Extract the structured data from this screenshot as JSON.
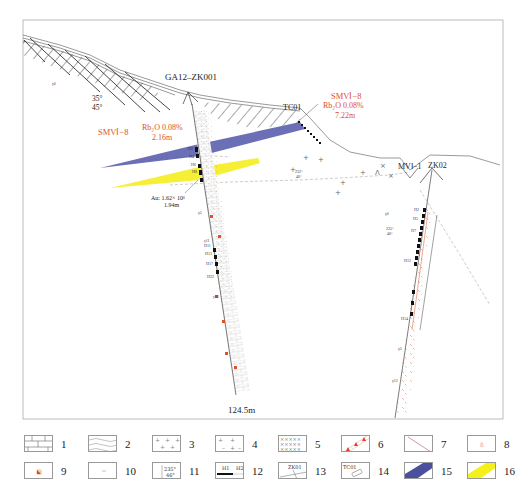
{
  "diagram": {
    "type": "geological-cross-section",
    "frame": {
      "x": 23,
      "y": 20,
      "w": 480,
      "h": 399
    }
  },
  "drillholes": [
    {
      "id": "GA12-ZK001",
      "label": "GA12–ZK001",
      "depth_label": "124.5m"
    },
    {
      "id": "ZK02",
      "label": "ZK02"
    }
  ],
  "trench": {
    "label": "TC01"
  },
  "section_label_mv": "MVⅠ−1",
  "orebodies": [
    {
      "name": "SMVI-8 (ZK001)",
      "label": "SMVⅠ−8",
      "grade": "Rb₂O 0.08%",
      "thickness": "2.16m",
      "color": "#6b6fb8"
    },
    {
      "name": "SMVI-8 (TC01)",
      "label": "SMVⅠ−8",
      "grade": "Rb₂O 0.08%",
      "thickness": "7.22m",
      "color": "#6b6fb8"
    },
    {
      "name": "Au body",
      "grade": "Au: 1.62× 10⁶",
      "thickness": "1.94m",
      "color": "#f4ee2a"
    }
  ],
  "attitudes": {
    "upper_left": {
      "a": "35°",
      "b": "45°"
    },
    "mid": {
      "a": "232°",
      "b": "46°"
    },
    "right": {
      "a": "235°",
      "b": "46°"
    }
  },
  "annotations": {
    "gamma": "γδ",
    "sample_labels_zk001": [
      "H2",
      "H3",
      "H4",
      "H5",
      "H6",
      "H7",
      "H8",
      "H9",
      "H11",
      "H13",
      "H15",
      "H17",
      "H22",
      "γ1",
      "γ5",
      "γ11",
      "γ13"
    ],
    "sample_labels_tc01": [
      "H1",
      "H2",
      "H3",
      "H4",
      "H5",
      "H6",
      "H7",
      "H8"
    ],
    "sample_labels_zk02": [
      "H2",
      "H5",
      "H6",
      "H7",
      "H8",
      "H9",
      "H11",
      "H12",
      "H13",
      "H14",
      "γ3",
      "γ5",
      "γ12"
    ]
  },
  "legend": {
    "items": [
      {
        "num": "1",
        "name": "limestone-brick"
      },
      {
        "num": "2",
        "name": "wavy-schist"
      },
      {
        "num": "3",
        "name": "plus-granite"
      },
      {
        "num": "4",
        "name": "plus-dash-granite"
      },
      {
        "num": "5",
        "name": "x-diorite"
      },
      {
        "num": "6",
        "name": "red-triangle-band"
      },
      {
        "num": "7",
        "name": "fault-line"
      },
      {
        "num": "8",
        "name": "pink-point"
      },
      {
        "num": "9",
        "name": "orange-mineral-point"
      },
      {
        "num": "10",
        "name": "dash-point"
      },
      {
        "num": "11",
        "name": "attitude",
        "text_a": "235°",
        "text_b": "46°"
      },
      {
        "num": "12",
        "name": "sample-bar",
        "text_a": "H1",
        "text_b": "H2"
      },
      {
        "num": "13",
        "name": "drillhole-symbol",
        "text_a": "ZK01"
      },
      {
        "num": "14",
        "name": "trench-symbol",
        "text_a": "TC01"
      },
      {
        "num": "15",
        "name": "rb-orebody",
        "color": "#4a4f9e"
      },
      {
        "num": "16",
        "name": "au-orebody",
        "color": "#f4f01a"
      }
    ]
  },
  "colors": {
    "rb_orebody": "#5a5fae",
    "au_orebody": "#f4ee2a",
    "annotation_red": "#e0502a",
    "line": "#444444"
  }
}
